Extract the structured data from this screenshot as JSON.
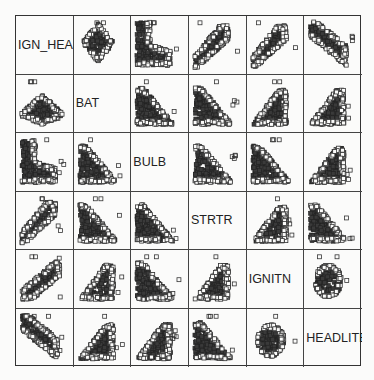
{
  "chart_data": {
    "type": "scatter",
    "subtype": "scatterplot-matrix",
    "title": "",
    "variables": [
      "IGN_HEAD",
      "BAT",
      "BULB",
      "STRTR",
      "IGNITN",
      "HEADLITE"
    ],
    "marker": "open-square",
    "marker_color": "#333333",
    "grid_rows": 6,
    "grid_cols": 6,
    "diagonal": "variable-labels",
    "shapes": [
      [
        "label",
        "diamond",
        "L-desc",
        "rise-sat",
        "rise-sat",
        "desc-diag"
      ],
      [
        "mound",
        "label",
        "tri-desc",
        "tri-desc",
        "tri-rise",
        "tri-rise"
      ],
      [
        "L-desc",
        "tri-desc",
        "label",
        "tri-desc",
        "tri-desc",
        "tri-rise"
      ],
      [
        "rise-sat",
        "tri-desc",
        "tri-desc",
        "label",
        "tri-rise",
        "tri-desc"
      ],
      [
        "rise-lin",
        "tri-rise",
        "tri-desc",
        "tri-rise",
        "label",
        "blob"
      ],
      [
        "desc-diag",
        "tri-rise",
        "tri-rise",
        "tri-desc",
        "blob",
        "label"
      ]
    ]
  },
  "labels": {
    "v0": "IGN_HEAD",
    "v1": "BAT",
    "v2": "BULB",
    "v3": "STRTR",
    "v4": "IGNITN",
    "v5": "HEADLITE"
  }
}
